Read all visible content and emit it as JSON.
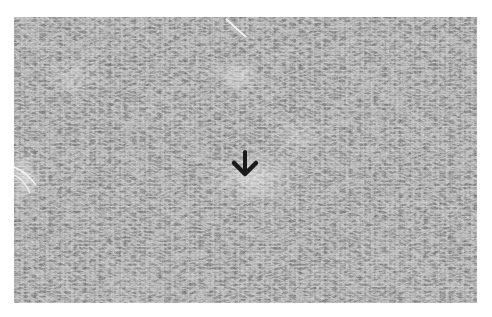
{
  "figure": {
    "kind": "grayscale histology micrograph",
    "annotation": {
      "type": "arrow",
      "direction": "down",
      "color": "#1a1a1a"
    },
    "colors": {
      "background": "#ffffff",
      "tissue_base": "#8a8a8a"
    }
  }
}
